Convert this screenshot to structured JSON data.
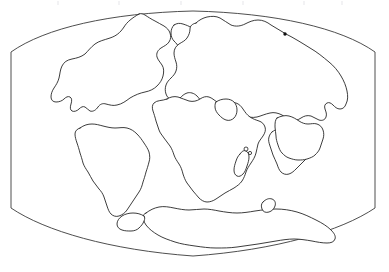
{
  "figure": {
    "projection": "lens-shaped (Mollweide-like) equal-area projection",
    "width_px": 389,
    "height_px": 272,
    "background_color": "#ffffff",
    "outline_color": "#1a1a1a",
    "frame_color": "#3a3a3a",
    "land_fill": "#ffffff"
  },
  "frame": {
    "name": "map-neatline",
    "left_edge_x": 11,
    "right_edge_x": 375,
    "side_top_y": 52,
    "side_bottom_y": 208,
    "top_apex_y": 11,
    "bottom_apex_y": 256,
    "apex_x": 193
  },
  "landmasses": [
    {
      "id": "north-america",
      "label": "North America",
      "position": "upper left"
    },
    {
      "id": "greenland",
      "label": "Greenland",
      "position": "upper center-left"
    },
    {
      "id": "eurasia",
      "label": "Eurasia",
      "position": "upper right"
    },
    {
      "id": "africa",
      "label": "Africa",
      "position": "center"
    },
    {
      "id": "south-america",
      "label": "South America",
      "position": "center left"
    },
    {
      "id": "india",
      "label": "India",
      "position": "center right"
    },
    {
      "id": "australia",
      "label": "Australia",
      "position": "right"
    },
    {
      "id": "madagascar",
      "label": "Madagascar",
      "position": "center right of Africa"
    },
    {
      "id": "antarctica",
      "label": "Antarctica",
      "position": "bottom"
    }
  ],
  "islands": [
    {
      "id": "islet-north",
      "label": "small island",
      "cx": 246,
      "cy": 149,
      "r": 2.0
    },
    {
      "id": "islet-south",
      "label": "small island",
      "cx": 250,
      "cy": 153,
      "r": 1.6
    }
  ],
  "markers": [
    {
      "id": "locality-marker",
      "label": "locality point",
      "cx": 285,
      "cy": 34,
      "r": 1.6
    }
  ],
  "ticks": {
    "name": "top-edge-tickmarks",
    "color": "#f2f2f4",
    "positions_x": [
      57,
      118,
      180,
      242,
      303,
      341
    ]
  }
}
